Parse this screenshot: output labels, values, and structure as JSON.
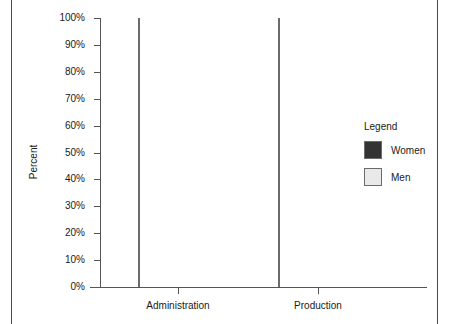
{
  "frame": {
    "left_rule": "page-rule",
    "right_rule": "page-rule"
  },
  "legend": {
    "title": "Legend",
    "entries": [
      {
        "label": "Women",
        "color": "#333333"
      },
      {
        "label": "Men",
        "color": "#e9e9e9"
      }
    ]
  },
  "chart_data": {
    "type": "bar",
    "stacked": true,
    "normalized": "100%",
    "title": "",
    "subtitle": "",
    "xlabel": "",
    "ylabel": "Percent",
    "categories": [
      "Administration",
      "Production"
    ],
    "series": [
      {
        "name": "Women",
        "color": "#333333",
        "values": [
          81,
          11
        ]
      },
      {
        "name": "Men",
        "color": "#e9e9e9",
        "values": [
          19,
          89
        ]
      }
    ],
    "ylim": [
      0,
      100
    ],
    "ytick_values": [
      0,
      10,
      20,
      30,
      40,
      50,
      60,
      70,
      80,
      90,
      100
    ],
    "ytick_labels": [
      "0%",
      "10%",
      "20%",
      "30%",
      "40%",
      "50%",
      "60%",
      "70%",
      "80%",
      "90%",
      "100%"
    ],
    "grid": false,
    "legend_position": "right",
    "annotations": []
  }
}
